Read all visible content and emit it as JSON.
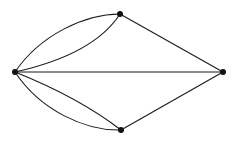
{
  "diagram": {
    "type": "multigraph",
    "colors": {
      "edge": "#1a1a1a",
      "vertex": "#111111",
      "background": "#ffffff"
    },
    "vertices": [
      {
        "id": "left",
        "x": 15,
        "y": 72
      },
      {
        "id": "top",
        "x": 120,
        "y": 14
      },
      {
        "id": "right",
        "x": 223,
        "y": 72
      },
      {
        "id": "bottom",
        "x": 121,
        "y": 130
      }
    ],
    "edges": [
      {
        "from": "left",
        "to": "top",
        "shape": "curve-outer"
      },
      {
        "from": "left",
        "to": "top",
        "shape": "curve-inner"
      },
      {
        "from": "left",
        "to": "bottom",
        "shape": "curve-outer"
      },
      {
        "from": "left",
        "to": "bottom",
        "shape": "curve-inner"
      },
      {
        "from": "left",
        "to": "right",
        "shape": "straight"
      },
      {
        "from": "top",
        "to": "right",
        "shape": "straight"
      },
      {
        "from": "bottom",
        "to": "right",
        "shape": "straight"
      }
    ]
  }
}
